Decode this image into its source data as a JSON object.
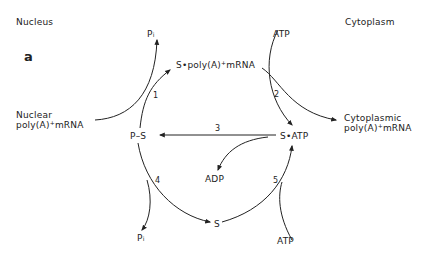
{
  "panel_label": "a",
  "regions": {
    "left": "Nucleus",
    "right": "Cytoplasm"
  },
  "nodes": {
    "pi_top": {
      "base": "P",
      "sub": "i"
    },
    "atp_top": "ATP",
    "s_polyA_mrna": {
      "pre": "S•poly(A)",
      "sup": "+",
      "post": "mRNA"
    },
    "nuclear_mrna": {
      "line1": "Nuclear",
      "line2_pre": "poly(A)",
      "sup": "+",
      "line2_post": "mRNA"
    },
    "cytoplasmic_mrna": {
      "line1": "Cytoplasmic",
      "line2_pre": "poly(A)",
      "sup": "+",
      "line2_post": "mRNA"
    },
    "p_s": "P–S",
    "s_atp": "S•ATP",
    "adp": "ADP",
    "s": "S",
    "pi_bottom": {
      "base": "P",
      "sub": "i"
    },
    "atp_bottom": "ATP"
  },
  "steps": [
    "1",
    "2",
    "3",
    "4",
    "5"
  ]
}
